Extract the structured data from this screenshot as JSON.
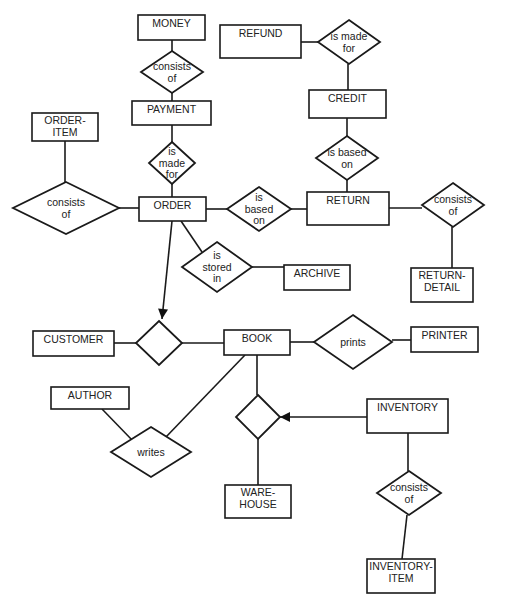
{
  "diagram": {
    "type": "entity-relationship",
    "colors": {
      "stroke": "#1a1a1a",
      "text": "#222222",
      "background": "#ffffff"
    },
    "entities": [
      {
        "id": "money",
        "lines": [
          "MONEY"
        ],
        "x": 138,
        "y": 15,
        "w": 67,
        "h": 25
      },
      {
        "id": "refund",
        "lines": [
          "REFUND"
        ],
        "x": 220,
        "y": 25,
        "w": 81,
        "h": 33
      },
      {
        "id": "payment",
        "lines": [
          "PAYMENT"
        ],
        "x": 132,
        "y": 101,
        "w": 79,
        "h": 24
      },
      {
        "id": "credit",
        "lines": [
          "CREDIT"
        ],
        "x": 309,
        "y": 90,
        "w": 77,
        "h": 28
      },
      {
        "id": "order-item",
        "lines": [
          "ORDER-",
          "ITEM"
        ],
        "x": 32,
        "y": 113,
        "w": 66,
        "h": 28
      },
      {
        "id": "order",
        "lines": [
          "ORDER"
        ],
        "x": 139,
        "y": 197,
        "w": 67,
        "h": 24
      },
      {
        "id": "return",
        "lines": [
          "RETURN"
        ],
        "x": 307,
        "y": 192,
        "w": 82,
        "h": 33
      },
      {
        "id": "archive",
        "lines": [
          "ARCHIVE"
        ],
        "x": 284,
        "y": 265,
        "w": 66,
        "h": 25
      },
      {
        "id": "return-detail",
        "lines": [
          "RETURN-",
          "DETAIL"
        ],
        "x": 411,
        "y": 268,
        "w": 62,
        "h": 34
      },
      {
        "id": "customer",
        "lines": [
          "CUSTOMER"
        ],
        "x": 33,
        "y": 331,
        "w": 81,
        "h": 25
      },
      {
        "id": "book",
        "lines": [
          "BOOK"
        ],
        "x": 224,
        "y": 330,
        "w": 66,
        "h": 25
      },
      {
        "id": "printer",
        "lines": [
          "PRINTER"
        ],
        "x": 411,
        "y": 327,
        "w": 67,
        "h": 25
      },
      {
        "id": "author",
        "lines": [
          "AUTHOR"
        ],
        "x": 51,
        "y": 387,
        "w": 78,
        "h": 22
      },
      {
        "id": "inventory",
        "lines": [
          "INVENTORY"
        ],
        "x": 367,
        "y": 399,
        "w": 81,
        "h": 34
      },
      {
        "id": "warehouse",
        "lines": [
          "WARE-",
          "HOUSE"
        ],
        "x": 225,
        "y": 485,
        "w": 66,
        "h": 33
      },
      {
        "id": "inventory-item",
        "lines": [
          "INVENTORY-",
          "ITEM"
        ],
        "x": 367,
        "y": 559,
        "w": 68,
        "h": 34
      }
    ],
    "relationships": [
      {
        "id": "money-consists-of",
        "lines": [
          "consists",
          "of"
        ],
        "cx": 172,
        "cy": 72,
        "w": 62,
        "h": 42
      },
      {
        "id": "refund-is-made-for",
        "lines": [
          "is made",
          "for"
        ],
        "cx": 349,
        "cy": 42,
        "w": 62,
        "h": 44
      },
      {
        "id": "payment-is-made-for",
        "lines": [
          "is",
          "made",
          "for"
        ],
        "cx": 172,
        "cy": 163,
        "w": 46,
        "h": 42
      },
      {
        "id": "credit-is-based-on",
        "lines": [
          "is based",
          "on"
        ],
        "cx": 347,
        "cy": 158,
        "w": 62,
        "h": 44
      },
      {
        "id": "order-consists-of",
        "lines": [
          "consists",
          "of"
        ],
        "cx": 66,
        "cy": 208,
        "w": 106,
        "h": 52
      },
      {
        "id": "order-is-based-on",
        "lines": [
          "is",
          "based",
          "on"
        ],
        "cx": 259,
        "cy": 209,
        "w": 64,
        "h": 44
      },
      {
        "id": "return-consists-of",
        "lines": [
          "consists",
          "of"
        ],
        "cx": 453,
        "cy": 205,
        "w": 62,
        "h": 44
      },
      {
        "id": "order-is-stored-in",
        "lines": [
          "is",
          "stored",
          "in"
        ],
        "cx": 217,
        "cy": 267,
        "w": 70,
        "h": 50
      },
      {
        "id": "customer-book-rel",
        "lines": [],
        "cx": 159,
        "cy": 343,
        "w": 46,
        "h": 44
      },
      {
        "id": "book-prints",
        "lines": [
          "prints"
        ],
        "cx": 353,
        "cy": 342,
        "w": 78,
        "h": 54
      },
      {
        "id": "book-warehouse-rel",
        "lines": [],
        "cx": 258,
        "cy": 417,
        "w": 44,
        "h": 44
      },
      {
        "id": "author-writes",
        "lines": [
          "writes"
        ],
        "cx": 151,
        "cy": 452,
        "w": 80,
        "h": 50
      },
      {
        "id": "inventory-consists-of",
        "lines": [
          "consists",
          "of"
        ],
        "cx": 409,
        "cy": 493,
        "w": 64,
        "h": 44
      }
    ],
    "edges": [
      {
        "from": "money",
        "to": "money-consists-of",
        "points": [
          [
            172,
            40
          ],
          [
            172,
            51
          ]
        ]
      },
      {
        "from": "money-consists-of",
        "to": "payment",
        "points": [
          [
            172,
            93
          ],
          [
            172,
            101
          ]
        ]
      },
      {
        "from": "refund",
        "to": "refund-is-made-for",
        "points": [
          [
            301,
            42
          ],
          [
            318,
            42
          ]
        ]
      },
      {
        "from": "refund-is-made-for",
        "to": "credit",
        "points": [
          [
            348,
            64
          ],
          [
            348,
            90
          ]
        ]
      },
      {
        "from": "payment",
        "to": "payment-is-made-for",
        "points": [
          [
            172,
            125
          ],
          [
            172,
            142
          ]
        ]
      },
      {
        "from": "payment-is-made-for",
        "to": "order",
        "points": [
          [
            172,
            184
          ],
          [
            172,
            197
          ]
        ]
      },
      {
        "from": "credit",
        "to": "credit-is-based-on",
        "points": [
          [
            347,
            118
          ],
          [
            347,
            136
          ]
        ]
      },
      {
        "from": "credit-is-based-on",
        "to": "return",
        "points": [
          [
            347,
            180
          ],
          [
            347,
            192
          ]
        ]
      },
      {
        "from": "order-item",
        "to": "order-consists-of",
        "points": [
          [
            65,
            141
          ],
          [
            65,
            182
          ]
        ]
      },
      {
        "from": "order-consists-of",
        "to": "order",
        "points": [
          [
            119,
            208
          ],
          [
            139,
            208
          ]
        ]
      },
      {
        "from": "order",
        "to": "order-is-based-on",
        "points": [
          [
            206,
            209
          ],
          [
            227,
            209
          ]
        ]
      },
      {
        "from": "order-is-based-on",
        "to": "return",
        "points": [
          [
            291,
            209
          ],
          [
            307,
            209
          ]
        ]
      },
      {
        "from": "return",
        "to": "return-consists-of",
        "points": [
          [
            389,
            208
          ],
          [
            422,
            208
          ]
        ]
      },
      {
        "from": "return-consists-of",
        "to": "return-detail",
        "points": [
          [
            452,
            227
          ],
          [
            452,
            268
          ]
        ]
      },
      {
        "from": "order",
        "to": "order-is-stored-in",
        "points": [
          [
            181,
            221
          ],
          [
            202,
            252
          ]
        ]
      },
      {
        "from": "order-is-stored-in",
        "to": "archive",
        "points": [
          [
            252,
            267
          ],
          [
            284,
            267
          ]
        ]
      },
      {
        "from": "order",
        "to": "customer-book-rel",
        "points": [
          [
            172,
            221
          ],
          [
            162,
            319
          ]
        ],
        "arrow": true
      },
      {
        "from": "customer",
        "to": "customer-book-rel",
        "points": [
          [
            114,
            343
          ],
          [
            136,
            343
          ]
        ]
      },
      {
        "from": "customer-book-rel",
        "to": "book",
        "points": [
          [
            182,
            343
          ],
          [
            224,
            343
          ]
        ]
      },
      {
        "from": "book",
        "to": "book-prints",
        "points": [
          [
            290,
            342
          ],
          [
            314,
            342
          ]
        ]
      },
      {
        "from": "book-prints",
        "to": "printer",
        "points": [
          [
            392,
            340
          ],
          [
            411,
            340
          ]
        ]
      },
      {
        "from": "book",
        "to": "book-warehouse-rel",
        "points": [
          [
            257,
            355
          ],
          [
            257,
            395
          ]
        ]
      },
      {
        "from": "book-warehouse-rel",
        "to": "warehouse",
        "points": [
          [
            258,
            439
          ],
          [
            258,
            485
          ]
        ]
      },
      {
        "from": "inventory",
        "to": "book-warehouse-rel",
        "points": [
          [
            367,
            417
          ],
          [
            280,
            417
          ]
        ],
        "arrow": true
      },
      {
        "from": "book",
        "to": "author-writes",
        "points": [
          [
            245,
            355
          ],
          [
            165,
            438
          ]
        ]
      },
      {
        "from": "author",
        "to": "author-writes",
        "points": [
          [
            102,
            409
          ],
          [
            133,
            441
          ]
        ]
      },
      {
        "from": "inventory",
        "to": "inventory-consists-of",
        "points": [
          [
            408,
            433
          ],
          [
            408,
            471
          ]
        ]
      },
      {
        "from": "inventory-consists-of",
        "to": "inventory-item",
        "points": [
          [
            407,
            515
          ],
          [
            402,
            559
          ]
        ]
      }
    ]
  }
}
